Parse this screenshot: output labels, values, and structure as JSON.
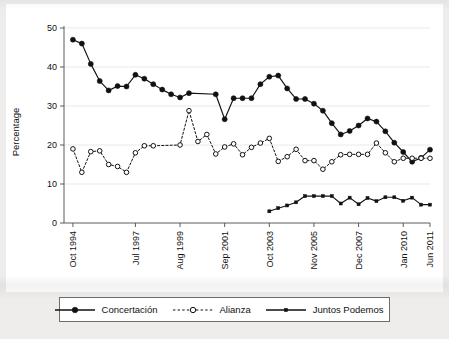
{
  "figure": {
    "background_color": "#eeedeb",
    "plot_background_color": "#ffffff",
    "line_color": "#111111",
    "grid_color": "#e3e3e3"
  },
  "legend": {
    "items": [
      {
        "label": "Concertación",
        "style": "solid-filled-circle",
        "marker": "filled-circle"
      },
      {
        "label": "Alianza",
        "style": "dashed-open-circle",
        "marker": "open-circle"
      },
      {
        "label": "Juntos Podemos",
        "style": "solid-small-square",
        "marker": "small-square"
      }
    ]
  },
  "chart_data": {
    "type": "line",
    "title": "",
    "xlabel": "",
    "ylabel": "Percentage",
    "ylim": [
      0,
      50
    ],
    "yticks": [
      0,
      10,
      20,
      30,
      40,
      50
    ],
    "grid": true,
    "legend_position": "bottom",
    "x_index_range": [
      0,
      41
    ],
    "xtick_positions": [
      1,
      8,
      13,
      18,
      23,
      28,
      33,
      38,
      41
    ],
    "xtick_labels": [
      "Oct 1994",
      "Jul 1997",
      "Aug 1999",
      "Sep 2001",
      "Oct 2003",
      "Nov 2005",
      "Dec 2007",
      "Jan 2010",
      "Jun 2011"
    ],
    "series": [
      {
        "name": "Concertación",
        "marker": "filled-circle",
        "linestyle": "solid",
        "x": [
          1,
          2,
          3,
          4,
          5,
          6,
          7,
          8,
          9,
          10,
          11,
          12,
          13,
          14,
          17,
          18,
          19,
          20,
          21,
          22,
          23,
          24,
          25,
          26,
          27,
          28,
          29,
          30,
          31,
          32,
          33,
          34,
          35,
          36,
          37,
          38,
          39,
          40,
          41
        ],
        "values": [
          47.0,
          46.0,
          40.8,
          36.4,
          34.0,
          35.1,
          35.0,
          38.0,
          37.0,
          35.6,
          34.2,
          33.0,
          32.2,
          33.3,
          33.0,
          26.6,
          32.0,
          32.0,
          32.0,
          35.6,
          37.5,
          37.8,
          34.5,
          31.8,
          31.8,
          30.6,
          28.8,
          25.6,
          22.7,
          23.6,
          25.0,
          26.8,
          26.0,
          23.5,
          20.6,
          18.2,
          15.7,
          16.7,
          18.8
        ]
      },
      {
        "name": "Alianza",
        "marker": "open-circle",
        "linestyle": "dashed",
        "x": [
          1,
          2,
          3,
          4,
          5,
          6,
          7,
          8,
          9,
          10,
          13,
          14,
          15,
          16,
          17,
          18,
          19,
          20,
          21,
          22,
          23,
          24,
          25,
          26,
          27,
          28,
          29,
          30,
          31,
          32,
          33,
          34,
          35,
          36,
          37,
          38,
          39,
          40,
          41
        ],
        "values": [
          19.0,
          13.0,
          18.3,
          18.5,
          15.0,
          14.5,
          13.0,
          18.0,
          19.8,
          19.8,
          20.0,
          28.8,
          20.9,
          22.7,
          17.7,
          19.5,
          20.3,
          17.5,
          19.4,
          20.5,
          21.7,
          15.8,
          17.0,
          18.9,
          16.0,
          16.0,
          13.8,
          15.7,
          17.5,
          17.6,
          17.6,
          17.6,
          20.5,
          18.0,
          15.7,
          16.6,
          16.6,
          16.6,
          16.6
        ]
      },
      {
        "name": "Juntos Podemos",
        "marker": "small-square",
        "linestyle": "solid",
        "x": [
          23,
          24,
          25,
          26,
          27,
          28,
          29,
          30,
          31,
          32,
          33,
          34,
          35,
          36,
          37,
          38,
          39,
          40,
          41
        ],
        "values": [
          3.0,
          3.8,
          4.5,
          5.3,
          6.9,
          6.9,
          6.9,
          6.9,
          5.0,
          6.5,
          4.8,
          6.4,
          5.6,
          6.6,
          6.6,
          5.7,
          6.5,
          4.7,
          4.7
        ]
      }
    ]
  }
}
